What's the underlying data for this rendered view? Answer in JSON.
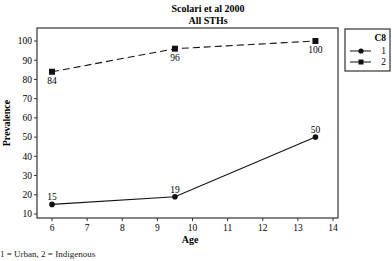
{
  "chart_data": {
    "type": "line",
    "title": "Scolari et al 2000",
    "subtitle": "All STHs",
    "xlabel": "Age",
    "ylabel": "Prevalence",
    "xlim": [
      6,
      14
    ],
    "ylim": [
      10,
      100
    ],
    "x_ticks": [
      6,
      7,
      8,
      9,
      10,
      11,
      12,
      13,
      14
    ],
    "y_ticks": [
      10,
      20,
      30,
      40,
      50,
      60,
      70,
      80,
      90,
      100
    ],
    "grid": false,
    "legend": {
      "title": "C8",
      "position": "right",
      "entries": [
        "1",
        "2"
      ]
    },
    "series": [
      {
        "name": "1",
        "marker": "circle",
        "line": "solid",
        "x": [
          6,
          9.5,
          13.5
        ],
        "values": [
          15,
          19,
          50
        ],
        "labels": [
          "15",
          "19",
          "50"
        ]
      },
      {
        "name": "2",
        "marker": "square",
        "line": "dashed",
        "x": [
          6,
          9.5,
          13.5
        ],
        "values": [
          84,
          96,
          100
        ],
        "labels": [
          "84",
          "96",
          "100"
        ]
      }
    ],
    "footnote": "1 = Urban, 2 = Indigenous"
  }
}
